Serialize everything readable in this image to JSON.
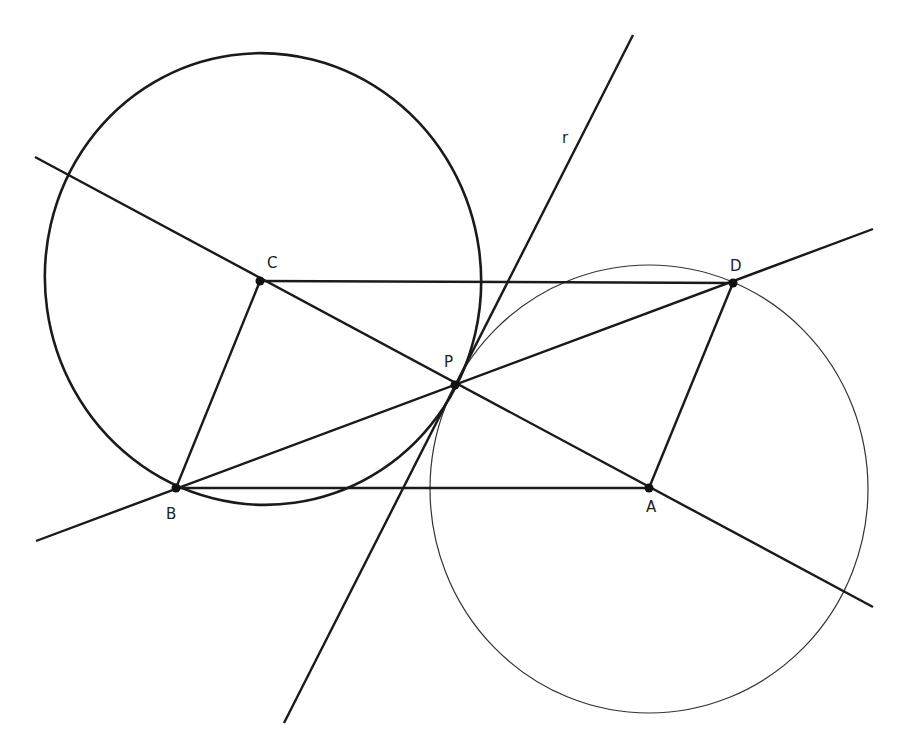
{
  "diagram": {
    "colors": {
      "stroke": "#1a1a1a",
      "background": "#ffffff",
      "thin_stroke": "#333333"
    },
    "points": {
      "C": {
        "label": "C",
        "x": 260,
        "y": 281
      },
      "D": {
        "label": "D",
        "x": 733,
        "y": 283
      },
      "P": {
        "label": "P",
        "x": 455,
        "y": 385
      },
      "B": {
        "label": "B",
        "x": 176,
        "y": 488
      },
      "A": {
        "label": "A",
        "x": 649,
        "y": 488
      }
    },
    "line_labels": {
      "r": "r"
    },
    "circles": [
      {
        "name": "circle-through-B-P",
        "cx": 263,
        "cy": 279,
        "rx": 218,
        "ry": 226,
        "weight": "thick"
      },
      {
        "name": "circle-through-D-P",
        "cx": 649,
        "cy": 489,
        "rx": 219,
        "ry": 224,
        "weight": "thin"
      }
    ],
    "lines": [
      {
        "name": "line-CA",
        "x1": 35,
        "y1": 157,
        "x2": 873,
        "y2": 607
      },
      {
        "name": "line-BD",
        "x1": 36,
        "y1": 541,
        "x2": 873,
        "y2": 229
      },
      {
        "name": "line-r",
        "x1": 633,
        "y1": 35,
        "x2": 284,
        "y2": 723
      }
    ],
    "segments": [
      {
        "name": "segment-CD",
        "from": "C",
        "to": "D"
      },
      {
        "name": "segment-BA",
        "from": "B",
        "to": "A"
      },
      {
        "name": "segment-CB",
        "from": "C",
        "to": "B"
      },
      {
        "name": "segment-DA",
        "from": "D",
        "to": "A"
      }
    ]
  }
}
